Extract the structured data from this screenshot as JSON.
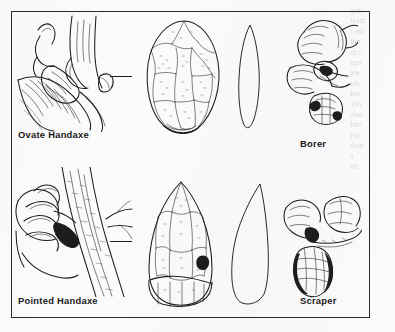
{
  "figure": {
    "background_color": "#fbfbfb",
    "frame_color": "#2b2b2b",
    "ink_color": "#1d1d1d",
    "type": "line-art illustration plate",
    "bleed_through_text": "ship\nmost\nthe r\nmit\nr to\nequ\nare\nolo\nted\nvily\nuals\nond\nnot\nnish\ne\nim"
  },
  "panels": [
    {
      "id": "ovate-handaxe",
      "label": "Ovate Handaxe",
      "label_position": "bottom-left",
      "scene": "hand gripping an ovate handaxe cutting into an animal carcass",
      "tool_face_view": "oval biface with radiating flake scars",
      "tool_profile_view": "narrow lenticular profile",
      "connector": true
    },
    {
      "id": "pointed-handaxe",
      "label": "Pointed Handaxe",
      "label_position": "bottom-left",
      "scene": "hand gripping a pointed handaxe chopping a tree branch",
      "tool_face_view": "pointed biface with flake scars and cortex butt",
      "tool_profile_view": "thick triangular profile",
      "connector": true
    },
    {
      "id": "borer",
      "label": "Borer",
      "label_position": "bottom-center",
      "scene": "two hands twisting a borer to drill a hole",
      "tool_view": "small flake tool with a projecting point",
      "connector": false
    },
    {
      "id": "scraper",
      "label": "Scraper",
      "label_position": "bottom-center",
      "scene": "two hands scraping a hide with a side scraper",
      "tool_view": "leaf-shaped retouched flake scraper",
      "connector": false
    }
  ]
}
